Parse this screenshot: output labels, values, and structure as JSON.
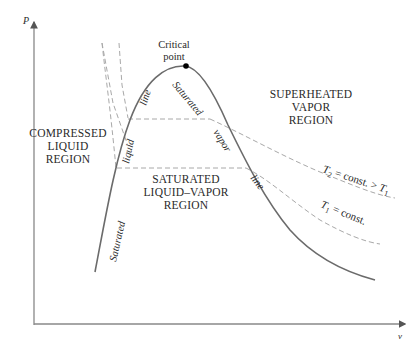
{
  "axes": {
    "y_label": "P",
    "x_label": "v"
  },
  "critical_point": {
    "line1": "Critical",
    "line2": "point"
  },
  "regions": {
    "compressed": [
      "COMPRESSED",
      "LIQUID",
      "REGION"
    ],
    "saturated_mixture": [
      "SATURATED",
      "LIQUID–VAPOR",
      "REGION"
    ],
    "superheated": [
      "SUPERHEATED",
      "VAPOR",
      "REGION"
    ]
  },
  "curve_labels": {
    "sat_liquid_1": "Saturated",
    "sat_liquid_2": "liquid",
    "sat_liquid_3": "line",
    "sat_vapor_1": "Saturated",
    "sat_vapor_2": "vapor",
    "sat_vapor_3": "line"
  },
  "isotherms": {
    "t2": {
      "sym": "T",
      "sub": "2",
      "rest": " = const. > ",
      "sym2": "T",
      "sub2": "1"
    },
    "t1": {
      "sym": "T",
      "sub": "1",
      "rest": " = const."
    }
  },
  "colors": {
    "curve": "#6b6b6b",
    "dashed": "#a8a8a8",
    "axis": "#888888",
    "text": "#2a2a2a"
  }
}
